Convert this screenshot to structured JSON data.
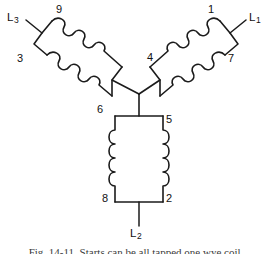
{
  "figure": {
    "background_color": "#ffffff",
    "line_color": "#1b1b1b",
    "caption": "Fig. 14-11. Starts can be all tapped one wye coil.",
    "caption_visible": "partially cropped at bottom edge"
  },
  "terminals": {
    "l1": {
      "label": "L",
      "sub": "1"
    },
    "l2": {
      "label": "L",
      "sub": "2"
    },
    "l3": {
      "label": "L",
      "sub": "3"
    }
  },
  "coil_numbers": {
    "right_coil_start": "1",
    "right_coil_inner": "4",
    "right_coil_end": "7",
    "left_coil_start": "9",
    "left_coil_outer": "3",
    "left_coil_inner": "6",
    "bottom_coil_top": "5",
    "bottom_coil_left": "8",
    "bottom_coil_right": "2"
  },
  "coils": [
    {
      "name": "phase-1-coil",
      "terminal_line": "L1",
      "numbers": [
        "1",
        "4",
        "7"
      ],
      "orientation": "upper-right-diagonal",
      "bumps_per_side": 4
    },
    {
      "name": "phase-3-coil",
      "terminal_line": "L3",
      "numbers": [
        "9",
        "3",
        "6"
      ],
      "orientation": "upper-left-diagonal",
      "bumps_per_side": 4
    },
    {
      "name": "phase-2-coil",
      "terminal_line": "L2",
      "numbers": [
        "5",
        "8",
        "2"
      ],
      "orientation": "vertical",
      "bumps_per_side": 4
    }
  ],
  "junction": {
    "name": "wye-center-point",
    "x": 139,
    "y": 94
  }
}
